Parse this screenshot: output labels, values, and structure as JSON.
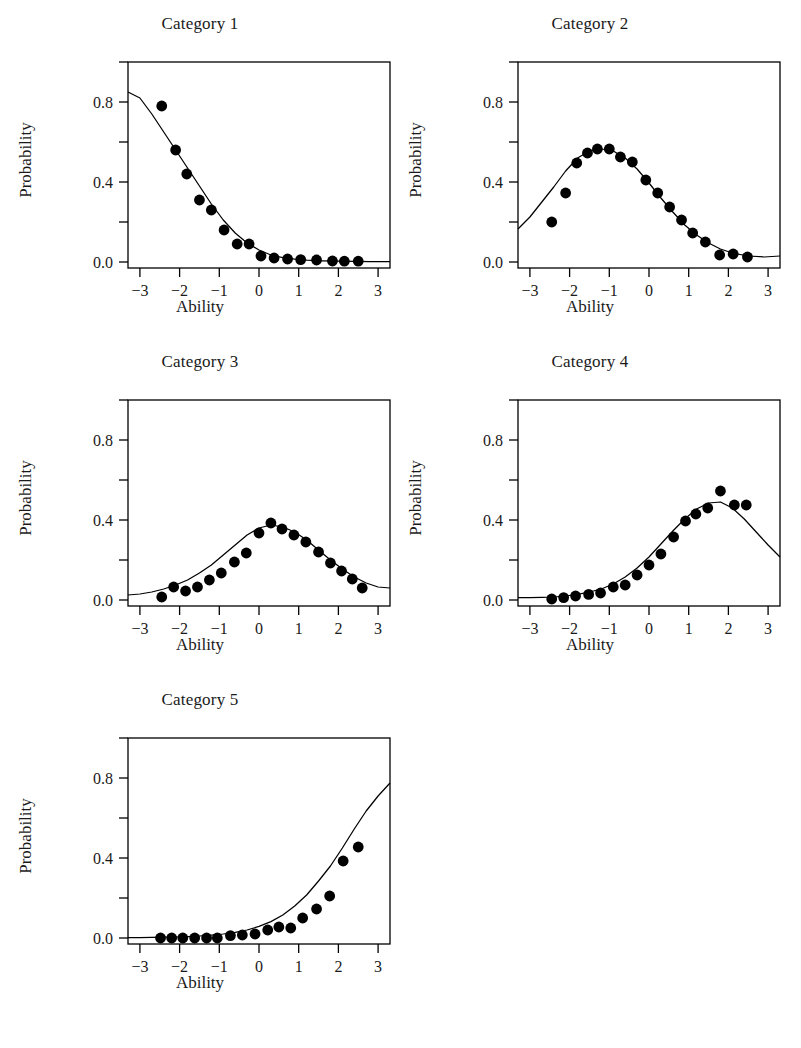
{
  "figure": {
    "panel_count": 5,
    "layout": "2-column grid, 3 rows; fifth panel in bottom-left",
    "axis_label_x": "Ability",
    "axis_label_y": "Probability",
    "line_color": "#000000",
    "point_color": "#000000",
    "background_color": "#ffffff"
  },
  "chart_data": [
    {
      "type": "scatter",
      "title": "Category 1",
      "xlabel": "Ability",
      "ylabel": "Probability",
      "xlim": [
        -3.3,
        3.3
      ],
      "ylim": [
        -0.03,
        1.0
      ],
      "xticks": [
        -3,
        -2,
        -1,
        0,
        1,
        2,
        3
      ],
      "xticklabels": [
        "-3",
        "-2",
        "-1",
        "0",
        "1",
        "2",
        "3"
      ],
      "yticks": [
        0.0,
        0.2,
        0.4,
        0.6,
        0.8,
        1.0
      ],
      "yticklabels": [
        "0.0",
        "",
        "0.4",
        "",
        "0.8",
        ""
      ],
      "grid": false,
      "legend": "none",
      "series": [
        {
          "name": "observed",
          "kind": "points",
          "x": [
            -2.45,
            -2.1,
            -1.82,
            -1.5,
            -1.2,
            -0.88,
            -0.55,
            -0.25,
            0.05,
            0.38,
            0.72,
            1.05,
            1.45,
            1.85,
            2.15,
            2.5
          ],
          "y": [
            0.78,
            0.56,
            0.44,
            0.31,
            0.26,
            0.16,
            0.09,
            0.09,
            0.03,
            0.02,
            0.015,
            0.012,
            0.01,
            0.005,
            0.004,
            0.004
          ]
        },
        {
          "name": "fitted",
          "kind": "line",
          "x": [
            -3.3,
            -3.0,
            -2.7,
            -2.4,
            -2.1,
            -1.8,
            -1.5,
            -1.2,
            -0.9,
            -0.6,
            -0.3,
            0.0,
            0.3,
            0.6,
            0.9,
            1.2,
            1.6,
            2.0,
            2.4,
            2.8,
            3.3
          ],
          "y": [
            0.85,
            0.82,
            0.74,
            0.65,
            0.56,
            0.47,
            0.38,
            0.29,
            0.21,
            0.145,
            0.095,
            0.06,
            0.035,
            0.022,
            0.014,
            0.009,
            0.006,
            0.004,
            0.003,
            0.002,
            0.002
          ]
        }
      ]
    },
    {
      "type": "scatter",
      "title": "Category 2",
      "xlabel": "Ability",
      "ylabel": "Probability",
      "xlim": [
        -3.3,
        3.3
      ],
      "ylim": [
        -0.03,
        1.0
      ],
      "xticks": [
        -3,
        -2,
        -1,
        0,
        1,
        2,
        3
      ],
      "xticklabels": [
        "-3",
        "-2",
        "-1",
        "0",
        "1",
        "2",
        "3"
      ],
      "yticks": [
        0.0,
        0.2,
        0.4,
        0.6,
        0.8,
        1.0
      ],
      "yticklabels": [
        "0.0",
        "",
        "0.4",
        "",
        "0.8",
        ""
      ],
      "grid": false,
      "legend": "none",
      "series": [
        {
          "name": "observed",
          "kind": "points",
          "x": [
            -2.45,
            -2.1,
            -1.82,
            -1.55,
            -1.3,
            -1.0,
            -0.72,
            -0.42,
            -0.08,
            0.22,
            0.52,
            0.82,
            1.1,
            1.42,
            1.78,
            2.12,
            2.48
          ],
          "y": [
            0.2,
            0.345,
            0.495,
            0.545,
            0.565,
            0.565,
            0.525,
            0.5,
            0.41,
            0.345,
            0.275,
            0.21,
            0.145,
            0.1,
            0.035,
            0.04,
            0.025
          ]
        },
        {
          "name": "fitted",
          "kind": "line",
          "x": [
            -3.3,
            -3.0,
            -2.7,
            -2.4,
            -2.1,
            -1.8,
            -1.5,
            -1.2,
            -0.9,
            -0.6,
            -0.3,
            0.0,
            0.3,
            0.6,
            0.9,
            1.2,
            1.5,
            1.8,
            2.1,
            2.5,
            2.9,
            3.3
          ],
          "y": [
            0.165,
            0.225,
            0.3,
            0.375,
            0.455,
            0.52,
            0.555,
            0.565,
            0.555,
            0.52,
            0.465,
            0.395,
            0.32,
            0.25,
            0.185,
            0.135,
            0.095,
            0.065,
            0.045,
            0.03,
            0.025,
            0.03
          ]
        }
      ]
    },
    {
      "type": "scatter",
      "title": "Category 3",
      "xlabel": "Ability",
      "ylabel": "Probability",
      "xlim": [
        -3.3,
        3.3
      ],
      "ylim": [
        -0.03,
        1.0
      ],
      "xticks": [
        -3,
        -2,
        -1,
        0,
        1,
        2,
        3
      ],
      "xticklabels": [
        "-3",
        "-2",
        "-1",
        "0",
        "1",
        "2",
        "3"
      ],
      "yticks": [
        0.0,
        0.2,
        0.4,
        0.6,
        0.8,
        1.0
      ],
      "yticklabels": [
        "0.0",
        "",
        "0.4",
        "",
        "0.8",
        ""
      ],
      "grid": false,
      "legend": "none",
      "series": [
        {
          "name": "observed",
          "kind": "points",
          "x": [
            -2.45,
            -2.15,
            -1.85,
            -1.55,
            -1.25,
            -0.95,
            -0.62,
            -0.32,
            0.0,
            0.3,
            0.58,
            0.88,
            1.18,
            1.5,
            1.8,
            2.08,
            2.35,
            2.6
          ],
          "y": [
            0.015,
            0.065,
            0.045,
            0.065,
            0.1,
            0.135,
            0.19,
            0.235,
            0.335,
            0.385,
            0.355,
            0.325,
            0.29,
            0.24,
            0.185,
            0.145,
            0.105,
            0.06
          ]
        },
        {
          "name": "fitted",
          "kind": "line",
          "x": [
            -3.3,
            -3.0,
            -2.7,
            -2.4,
            -2.1,
            -1.8,
            -1.5,
            -1.2,
            -0.9,
            -0.6,
            -0.3,
            0.0,
            0.3,
            0.6,
            0.9,
            1.2,
            1.5,
            1.8,
            2.1,
            2.4,
            2.7,
            3.0,
            3.3
          ],
          "y": [
            0.025,
            0.03,
            0.04,
            0.055,
            0.075,
            0.1,
            0.135,
            0.175,
            0.225,
            0.275,
            0.325,
            0.36,
            0.375,
            0.365,
            0.34,
            0.3,
            0.25,
            0.2,
            0.155,
            0.115,
            0.085,
            0.065,
            0.06
          ]
        }
      ]
    },
    {
      "type": "scatter",
      "title": "Category 4",
      "xlabel": "Ability",
      "ylabel": "Probability",
      "xlim": [
        -3.3,
        3.3
      ],
      "ylim": [
        -0.03,
        1.0
      ],
      "xticks": [
        -3,
        -2,
        -1,
        0,
        1,
        2,
        3
      ],
      "xticklabels": [
        "-3",
        "-2",
        "-1",
        "0",
        "1",
        "2",
        "3"
      ],
      "yticks": [
        0.0,
        0.2,
        0.4,
        0.6,
        0.8,
        1.0
      ],
      "yticklabels": [
        "0.0",
        "",
        "0.4",
        "",
        "0.8",
        ""
      ],
      "grid": false,
      "legend": "none",
      "series": [
        {
          "name": "observed",
          "kind": "points",
          "x": [
            -2.45,
            -2.15,
            -1.85,
            -1.52,
            -1.22,
            -0.9,
            -0.6,
            -0.3,
            0.0,
            0.3,
            0.62,
            0.92,
            1.18,
            1.48,
            1.8,
            2.15,
            2.45
          ],
          "y": [
            0.005,
            0.012,
            0.02,
            0.028,
            0.035,
            0.065,
            0.075,
            0.125,
            0.175,
            0.23,
            0.315,
            0.395,
            0.43,
            0.46,
            0.545,
            0.475,
            0.475
          ]
        },
        {
          "name": "fitted",
          "kind": "line",
          "x": [
            -3.3,
            -3.0,
            -2.7,
            -2.4,
            -2.1,
            -1.8,
            -1.5,
            -1.2,
            -0.9,
            -0.6,
            -0.3,
            0.0,
            0.3,
            0.6,
            0.9,
            1.2,
            1.5,
            1.8,
            2.1,
            2.4,
            2.7,
            3.0,
            3.3
          ],
          "y": [
            0.012,
            0.012,
            0.013,
            0.015,
            0.02,
            0.028,
            0.04,
            0.055,
            0.08,
            0.115,
            0.16,
            0.215,
            0.28,
            0.345,
            0.405,
            0.455,
            0.485,
            0.49,
            0.46,
            0.405,
            0.34,
            0.275,
            0.215
          ]
        }
      ]
    },
    {
      "type": "scatter",
      "title": "Category 5",
      "xlabel": "Ability",
      "ylabel": "Probability",
      "xlim": [
        -3.3,
        3.3
      ],
      "ylim": [
        -0.03,
        1.0
      ],
      "xticks": [
        -3,
        -2,
        -1,
        0,
        1,
        2,
        3
      ],
      "xticklabels": [
        "-3",
        "-2",
        "-1",
        "0",
        "1",
        "2",
        "3"
      ],
      "yticks": [
        0.0,
        0.2,
        0.4,
        0.6,
        0.8,
        1.0
      ],
      "yticklabels": [
        "0.0",
        "",
        "0.4",
        "",
        "0.8",
        ""
      ],
      "grid": false,
      "legend": "none",
      "series": [
        {
          "name": "observed",
          "kind": "points",
          "x": [
            -2.48,
            -2.2,
            -1.92,
            -1.62,
            -1.32,
            -1.05,
            -0.72,
            -0.42,
            -0.1,
            0.22,
            0.5,
            0.8,
            1.1,
            1.45,
            1.78,
            2.12,
            2.5
          ],
          "y": [
            0.0,
            0.0,
            0.0,
            0.0,
            0.0,
            0.0,
            0.012,
            0.015,
            0.02,
            0.04,
            0.055,
            0.05,
            0.1,
            0.145,
            0.21,
            0.385,
            0.455
          ]
        },
        {
          "name": "fitted",
          "kind": "line",
          "x": [
            -3.3,
            -3.0,
            -2.7,
            -2.4,
            -2.1,
            -1.8,
            -1.5,
            -1.2,
            -0.9,
            -0.6,
            -0.3,
            0.0,
            0.3,
            0.6,
            0.9,
            1.2,
            1.5,
            1.8,
            2.1,
            2.4,
            2.7,
            3.0,
            3.3
          ],
          "y": [
            0.002,
            0.002,
            0.003,
            0.004,
            0.005,
            0.007,
            0.01,
            0.014,
            0.02,
            0.028,
            0.04,
            0.058,
            0.082,
            0.115,
            0.16,
            0.215,
            0.285,
            0.36,
            0.45,
            0.545,
            0.635,
            0.71,
            0.775
          ]
        }
      ]
    }
  ]
}
